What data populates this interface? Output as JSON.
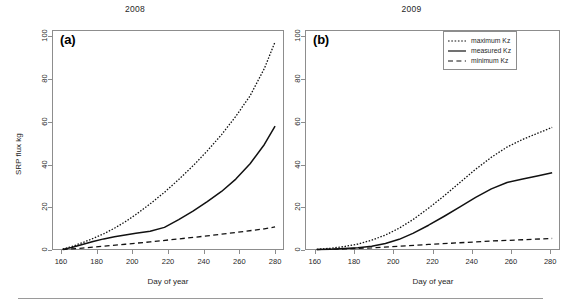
{
  "figure": {
    "axis_title_x": "Day of year",
    "axis_title_y": "SRP flux kg",
    "panel_a_letter": "(a)",
    "panel_b_letter": "(b)"
  },
  "legend": {
    "position": "top-right",
    "items": [
      {
        "label": "maximum Kz",
        "style": "dotted",
        "key_name": "legend-key-maximum"
      },
      {
        "label": "measured Kz",
        "style": "solid",
        "key_name": "legend-key-measured"
      },
      {
        "label": "minimum Kz",
        "style": "dashed",
        "key_name": "legend-key-minimum"
      }
    ]
  },
  "axis": {
    "x_ticks": [
      "160",
      "180",
      "200",
      "220",
      "240",
      "260",
      "280"
    ],
    "y_ticks": [
      "0",
      "20",
      "40",
      "60",
      "80",
      "100"
    ]
  },
  "chart_data": [
    {
      "type": "line",
      "title": "2008",
      "panel": "(a)",
      "xlabel": "Day of year",
      "ylabel": "SRP flux kg",
      "xlim": [
        155,
        285
      ],
      "ylim": [
        0,
        103
      ],
      "xticks": [
        160,
        180,
        200,
        220,
        240,
        260,
        280
      ],
      "yticks": [
        0,
        20,
        40,
        60,
        80,
        100
      ],
      "grid": false,
      "series": [
        {
          "name": "maximum Kz",
          "style": "dotted",
          "x": [
            161,
            166,
            172,
            178,
            184,
            190,
            196,
            202,
            210,
            218,
            226,
            234,
            242,
            250,
            258,
            266,
            274,
            280
          ],
          "y": [
            0.4,
            1.6,
            3.4,
            5.4,
            7.6,
            10.2,
            13.2,
            16.6,
            21.6,
            27.0,
            33.0,
            39.4,
            46.4,
            54.0,
            62.6,
            72.2,
            85.0,
            97.5
          ]
        },
        {
          "name": "measured Kz",
          "style": "solid",
          "x": [
            161,
            166,
            172,
            178,
            184,
            190,
            196,
            202,
            210,
            218,
            226,
            234,
            242,
            250,
            258,
            266,
            274,
            280
          ],
          "y": [
            0.3,
            1.2,
            2.6,
            4.0,
            5.2,
            6.2,
            7.0,
            7.8,
            8.8,
            10.6,
            14.2,
            18.2,
            22.6,
            27.4,
            33.2,
            40.4,
            49.4,
            58.0
          ]
        },
        {
          "name": "minimum Kz",
          "style": "dashed",
          "x": [
            161,
            172,
            184,
            196,
            210,
            226,
            242,
            258,
            274,
            280
          ],
          "y": [
            0.2,
            0.9,
            1.8,
            2.7,
            3.8,
            5.2,
            6.6,
            8.2,
            9.9,
            10.8
          ]
        }
      ]
    },
    {
      "type": "line",
      "title": "2009",
      "panel": "(b)",
      "xlabel": "Day of year",
      "ylabel": "SRP flux kg",
      "xlim": [
        155,
        285
      ],
      "ylim": [
        0,
        103
      ],
      "xticks": [
        160,
        180,
        200,
        220,
        240,
        260,
        280
      ],
      "yticks": [
        0,
        20,
        40,
        60,
        80,
        100
      ],
      "grid": false,
      "series": [
        {
          "name": "maximum Kz",
          "style": "dotted",
          "x": [
            161,
            168,
            175,
            182,
            189,
            196,
            203,
            210,
            218,
            226,
            234,
            242,
            250,
            258,
            266,
            274,
            281
          ],
          "y": [
            0.3,
            0.8,
            1.6,
            2.8,
            4.6,
            7.0,
            10.2,
            14.2,
            19.6,
            25.4,
            31.6,
            37.8,
            43.4,
            48.2,
            51.8,
            54.8,
            57.4
          ]
        },
        {
          "name": "measured Kz",
          "style": "solid",
          "x": [
            161,
            168,
            175,
            182,
            189,
            196,
            203,
            210,
            218,
            226,
            234,
            242,
            250,
            258,
            266,
            274,
            281
          ],
          "y": [
            0.2,
            0.4,
            0.7,
            1.1,
            1.8,
            3.0,
            5.0,
            7.8,
            11.6,
            15.8,
            20.2,
            24.6,
            28.6,
            31.6,
            33.2,
            34.8,
            36.2
          ]
        },
        {
          "name": "minimum Kz",
          "style": "dashed",
          "x": [
            161,
            175,
            189,
            203,
            218,
            234,
            250,
            266,
            281
          ],
          "y": [
            0.2,
            0.5,
            1.0,
            1.8,
            2.6,
            3.4,
            4.2,
            4.8,
            5.4
          ]
        }
      ]
    }
  ]
}
